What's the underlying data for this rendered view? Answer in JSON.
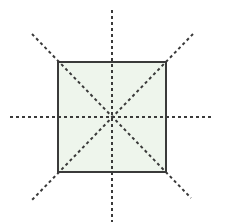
{
  "diagram": {
    "canvas": {
      "width": 226,
      "height": 223,
      "background": "#ffffff"
    },
    "square": {
      "x": 58,
      "y": 62,
      "width": 108,
      "height": 110,
      "fill": "#eef5ec",
      "stroke": "#3a3a3a",
      "stroke_width": 2
    },
    "center": {
      "x": 112,
      "y": 117
    },
    "symmetry_lines": [
      {
        "name": "vertical-line",
        "x1": 112,
        "y1": 10,
        "x2": 112,
        "y2": 222
      },
      {
        "name": "horizontal-line",
        "x1": 10,
        "y1": 117,
        "x2": 214,
        "y2": 117
      },
      {
        "name": "diagonal-line-tl-br",
        "x1": 32,
        "y1": 34,
        "x2": 191,
        "y2": 198
      },
      {
        "name": "diagonal-line-tr-bl",
        "x1": 193,
        "y1": 34,
        "x2": 32,
        "y2": 200
      }
    ],
    "line_style": {
      "stroke": "#3a3a3a",
      "stroke_width": 2,
      "dash": "3 3"
    },
    "symmetry_line_count": 4
  }
}
